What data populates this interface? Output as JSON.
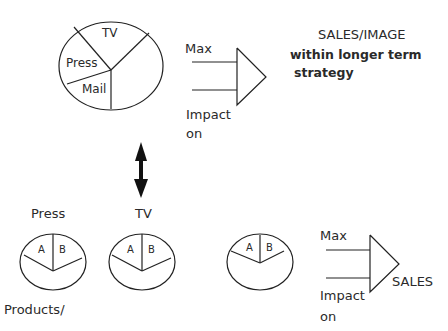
{
  "diagram": {
    "colors": {
      "stroke": "#222222",
      "background": "#ffffff",
      "text": "#2a2a2a"
    },
    "top_pie": {
      "segments": [
        "TV",
        "Press",
        "Mail"
      ]
    },
    "top_arrow": {
      "max_label": "Max",
      "impact_label": "Impact",
      "on_label": "on"
    },
    "top_goal": {
      "title": "SALES/IMAGE",
      "line1": "within longer term",
      "line2": "strategy"
    },
    "link_icon": "double-arrow-vertical",
    "bottom_pies": [
      {
        "label": "Press",
        "segments": [
          "A",
          "B"
        ]
      },
      {
        "label": "TV",
        "segments": [
          "A",
          "B"
        ]
      },
      {
        "label": "",
        "segments": [
          "A",
          "B"
        ]
      }
    ],
    "bottom_arrow": {
      "max_label": "Max",
      "impact_label": "Impact",
      "on_label": "on",
      "target_label": "SALES"
    },
    "footer_label": "Products/"
  }
}
